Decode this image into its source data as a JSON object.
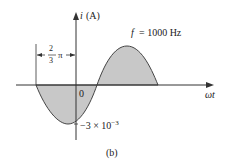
{
  "diagram": {
    "axis_y_label_var": "i",
    "axis_y_label_unit": "(A)",
    "axis_x_label": "ωt",
    "origin_label": "0",
    "frequency_var": "f",
    "frequency_value": "= 1000 Hz",
    "phase_shift_num": "2",
    "phase_shift_den": "3",
    "phase_shift_pi": "π",
    "peak_label": "−3 × 10",
    "peak_label_exp": "−3",
    "caption": "(b)",
    "fill_color": "#c8c8c8",
    "line_color": "#333333"
  }
}
